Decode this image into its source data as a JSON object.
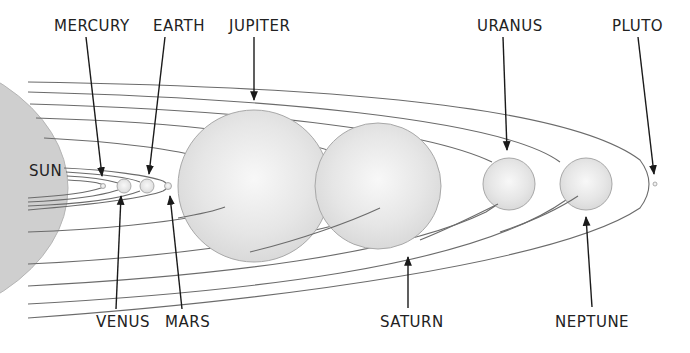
{
  "diagram": {
    "colors": {
      "background": "#ffffff",
      "planet_fill": "#e2e2e2",
      "planet_highlight": "#f7f7f7",
      "planet_stroke": "#a8a8a8",
      "sun_fill": "#cfcfcf",
      "orbit_stroke": "#6b6b6b",
      "arrow": "#1a1a1a",
      "text": "#222222"
    },
    "bodies": [
      {
        "id": "sun",
        "label": "SUN"
      },
      {
        "id": "mercury",
        "label": "MERCURY"
      },
      {
        "id": "venus",
        "label": "VENUS"
      },
      {
        "id": "earth",
        "label": "EARTH"
      },
      {
        "id": "mars",
        "label": "MARS"
      },
      {
        "id": "jupiter",
        "label": "JUPITER"
      },
      {
        "id": "saturn",
        "label": "SATURN"
      },
      {
        "id": "uranus",
        "label": "URANUS"
      },
      {
        "id": "neptune",
        "label": "NEPTUNE"
      },
      {
        "id": "pluto",
        "label": "PLUTO"
      }
    ]
  }
}
